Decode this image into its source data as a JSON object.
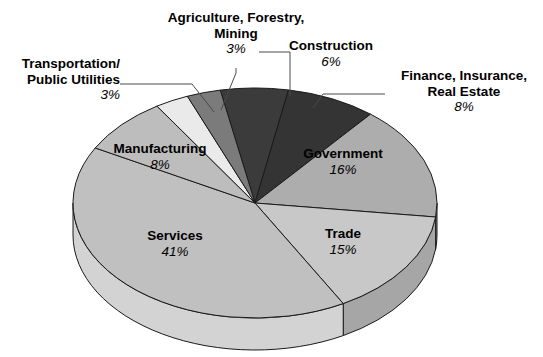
{
  "chart_data": {
    "type": "pie",
    "title": "",
    "subtitle": "",
    "xlabel": "",
    "ylabel": "",
    "legend_position": "none",
    "grid": false,
    "total": 100,
    "units": "percent",
    "categories": [
      "Construction",
      "Finance, Insurance, Real Estate",
      "Government",
      "Trade",
      "Services",
      "Manufacturing",
      "Transportation/Public Utilities",
      "Agriculture, Forestry, Mining"
    ],
    "values": [
      6,
      8,
      16,
      15,
      41,
      8,
      3,
      3
    ],
    "slices": [
      {
        "id": "construction",
        "label": "Construction",
        "label_lines": [
          "Construction"
        ],
        "percent_text": "6%",
        "value": 6,
        "color": "#3b3b3b",
        "side_color": "#2a2a2a",
        "label_placement": "outside",
        "leader": true
      },
      {
        "id": "finance-insurance-real-estate",
        "label": "Finance, Insurance, Real Estate",
        "label_lines": [
          "Finance, Insurance,",
          "Real Estate"
        ],
        "percent_text": "8%",
        "value": 8,
        "color": "#343434",
        "side_color": "#242424",
        "label_placement": "outside",
        "leader": true
      },
      {
        "id": "government",
        "label": "Government",
        "label_lines": [
          "Government"
        ],
        "percent_text": "16%",
        "value": 16,
        "color": "#adadad",
        "side_color": "#8e8e8e",
        "label_placement": "inside",
        "leader": false
      },
      {
        "id": "trade",
        "label": "Trade",
        "label_lines": [
          "Trade"
        ],
        "percent_text": "15%",
        "value": 15,
        "color": "#c8c8c8",
        "side_color": "#a6a6a6",
        "label_placement": "inside",
        "leader": false
      },
      {
        "id": "services",
        "label": "Services",
        "label_lines": [
          "Services"
        ],
        "percent_text": "41%",
        "value": 41,
        "color": "#c0c0c0",
        "side_color": "#d3d3d3",
        "label_placement": "inside",
        "leader": false
      },
      {
        "id": "manufacturing",
        "label": "Manufacturing",
        "label_lines": [
          "Manufacturing"
        ],
        "percent_text": "8%",
        "value": 8,
        "color": "#bdbdbd",
        "side_color": "#a0a0a0",
        "label_placement": "inside",
        "leader": false
      },
      {
        "id": "transportation-public-utilities",
        "label": "Transportation/Public Utilities",
        "label_lines": [
          "Transportation/",
          "Public Utilities"
        ],
        "percent_text": "3%",
        "value": 3,
        "color": "#eaeaea",
        "side_color": "#cfcfcf",
        "label_placement": "outside",
        "leader": true
      },
      {
        "id": "agriculture-forestry-mining",
        "label": "Agriculture, Forestry, Mining",
        "label_lines": [
          "Agriculture, Forestry,",
          "Mining"
        ],
        "percent_text": "3%",
        "value": 3,
        "color": "#7b7b7b",
        "side_color": "#636363",
        "label_placement": "outside",
        "leader": true
      }
    ]
  },
  "labels": {
    "agriculture_line1": "Agriculture, Forestry,",
    "agriculture_line2": "Mining",
    "agriculture_pct": "3%",
    "transportation_line1": "Transportation/",
    "transportation_line2": "Public Utilities",
    "transportation_pct": "3%",
    "construction_line1": "Construction",
    "construction_pct": "6%",
    "finance_line1": "Finance, Insurance,",
    "finance_line2": "Real Estate",
    "finance_pct": "8%",
    "manufacturing_line1": "Manufacturing",
    "manufacturing_pct": "8%",
    "government_line1": "Government",
    "government_pct": "16%",
    "services_line1": "Services",
    "services_pct": "41%",
    "trade_line1": "Trade",
    "trade_pct": "15%"
  },
  "colors": {
    "background": "#ffffff",
    "outline": "#1a1a1a",
    "leader_line": "#4a4a4a",
    "text": "#000000"
  }
}
